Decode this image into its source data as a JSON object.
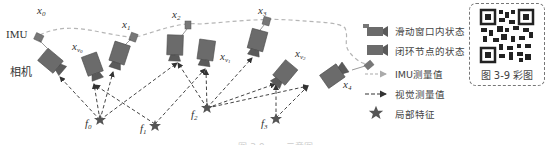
{
  "diagram": {
    "labels": {
      "imu": "IMU",
      "camera": "相机"
    },
    "states": [
      {
        "id": "x0",
        "base": "x",
        "sub": "0"
      },
      {
        "id": "x1",
        "base": "x",
        "sub": "1"
      },
      {
        "id": "x2",
        "base": "x",
        "sub": "2"
      },
      {
        "id": "x3",
        "base": "x",
        "sub": "3"
      },
      {
        "id": "x4",
        "base": "x",
        "sub": "4"
      }
    ],
    "loop_nodes": [
      {
        "id": "xv0",
        "base": "x",
        "sub": "v",
        "subsub": "0"
      },
      {
        "id": "xv1",
        "base": "x",
        "sub": "v",
        "subsub": "1"
      },
      {
        "id": "xv2",
        "base": "x",
        "sub": "v",
        "subsub": "2"
      }
    ],
    "features": [
      {
        "id": "f0",
        "base": "f",
        "sub": "0"
      },
      {
        "id": "f1",
        "base": "f",
        "sub": "1"
      },
      {
        "id": "f2",
        "base": "f",
        "sub": "2"
      },
      {
        "id": "f3",
        "base": "f",
        "sub": "3"
      }
    ],
    "colors": {
      "camera_body": "#6b6b6b",
      "camera_edge": "#4a4a4a",
      "imu_line": "#b0b0b0",
      "visual_arrow": "#444444",
      "star": "#555555"
    }
  },
  "legend": {
    "items": [
      {
        "icon": "sliding-window-camera-icon",
        "label": "滑动窗口内状态"
      },
      {
        "icon": "loop-node-camera-icon",
        "label": "闭环节点的状态"
      },
      {
        "icon": "imu-dashed-line-icon",
        "label": "IMU测量值"
      },
      {
        "icon": "visual-dashed-arrow-icon",
        "label": "视觉测量值"
      },
      {
        "icon": "star-icon",
        "label": "局部特征"
      }
    ]
  },
  "qr": {
    "caption": "图 3-9 彩图"
  },
  "figure_caption": "图 3-9 ……示意图"
}
